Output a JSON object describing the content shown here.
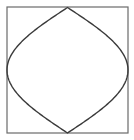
{
  "diagram": {
    "colors": {
      "background": "#ffffff",
      "frame_stroke": "#6a6a6a",
      "curve_stroke": "#3a3a3a"
    },
    "frame": {
      "x": 7,
      "y": 7,
      "width": 121,
      "height": 126
    },
    "curve": {
      "top": [
        67.5,
        7.5
      ],
      "right": [
        128,
        70
      ],
      "bottom": [
        67.5,
        133
      ],
      "left": [
        7,
        70
      ],
      "shape": "sinusoidal-lens"
    }
  }
}
